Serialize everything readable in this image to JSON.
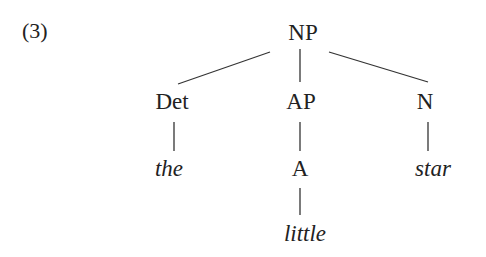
{
  "example_number": "(3)",
  "tree": {
    "root": "NP",
    "children": [
      {
        "label": "Det",
        "leaf": "the"
      },
      {
        "label": "AP",
        "child": "A",
        "leaf": "little"
      },
      {
        "label": "N",
        "leaf": "star"
      }
    ]
  },
  "labels": {
    "np": "NP",
    "det": "Det",
    "ap": "AP",
    "n": "N",
    "the": "the",
    "a": "A",
    "star": "star",
    "little": "little"
  }
}
